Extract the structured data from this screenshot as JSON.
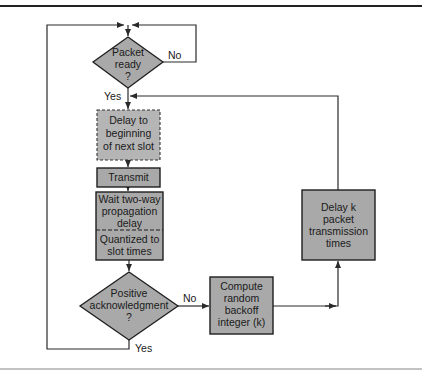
{
  "colors": {
    "node_fill": "#a9a9a9",
    "node_stroke": "#1e1e1e",
    "line": "#2a2a2a",
    "rule": "#222222",
    "background": "#ffffff"
  },
  "nodes": {
    "packet_ready": {
      "type": "decision",
      "lines": [
        "Packet",
        "ready",
        "?"
      ]
    },
    "delay_slot": {
      "type": "process-dashed",
      "lines": [
        "Delay to",
        "beginning",
        "of next slot"
      ]
    },
    "transmit": {
      "type": "process",
      "lines": [
        "Transmit"
      ]
    },
    "wait_prop": {
      "type": "process-split",
      "top_lines": [
        "Wait two-way",
        "propagation",
        "delay"
      ],
      "bottom_lines": [
        "Quantized to",
        "slot times"
      ]
    },
    "positive_ack": {
      "type": "decision",
      "lines": [
        "Positive",
        "acknowledgment",
        "?"
      ]
    },
    "compute_backoff": {
      "type": "process",
      "lines": [
        "Compute",
        "random",
        "backoff",
        "integer (k)"
      ]
    },
    "delay_k": {
      "type": "process",
      "lines": [
        "Delay k",
        "packet",
        "transmission",
        "times"
      ]
    }
  },
  "edge_labels": {
    "packet_ready_no": "No",
    "packet_ready_yes": "Yes",
    "ack_no": "No",
    "ack_yes": "Yes"
  }
}
